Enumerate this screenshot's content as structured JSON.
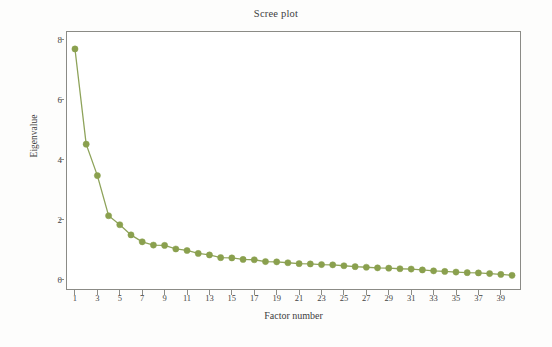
{
  "chart_data": {
    "type": "line",
    "title": "Scree plot",
    "xlabel": "Factor number",
    "ylabel": "Eigenvalue",
    "xlim": [
      0.2,
      40.8
    ],
    "ylim": [
      -0.35,
      8.3
    ],
    "grid": false,
    "legend": null,
    "marker": "circle",
    "series_color": "#8aa04e",
    "line_color": "#8ea35a",
    "x": [
      1,
      2,
      3,
      4,
      5,
      6,
      7,
      8,
      9,
      10,
      11,
      12,
      13,
      14,
      15,
      16,
      17,
      18,
      19,
      20,
      21,
      22,
      23,
      24,
      25,
      26,
      27,
      28,
      29,
      30,
      31,
      32,
      33,
      34,
      35,
      36,
      37,
      38,
      39,
      40
    ],
    "values": [
      7.7,
      4.52,
      3.47,
      2.13,
      1.83,
      1.49,
      1.26,
      1.15,
      1.14,
      1.02,
      0.97,
      0.87,
      0.82,
      0.73,
      0.72,
      0.67,
      0.66,
      0.6,
      0.59,
      0.56,
      0.53,
      0.52,
      0.5,
      0.49,
      0.46,
      0.43,
      0.41,
      0.39,
      0.38,
      0.36,
      0.35,
      0.32,
      0.29,
      0.27,
      0.25,
      0.23,
      0.22,
      0.2,
      0.17,
      0.14
    ],
    "ytick_values": [
      0,
      2,
      4,
      6,
      8
    ],
    "ytick_labels": [
      "0",
      "2",
      "4",
      "6",
      "8"
    ],
    "xtick_values": [
      1,
      3,
      5,
      7,
      9,
      11,
      13,
      15,
      17,
      19,
      21,
      23,
      25,
      27,
      29,
      31,
      33,
      35,
      37,
      39
    ],
    "xtick_labels": [
      "1",
      "3",
      "5",
      "7",
      "9",
      "11",
      "13",
      "15",
      "17",
      "19",
      "21",
      "23",
      "25",
      "27",
      "29",
      "31",
      "33",
      "35",
      "37",
      "39"
    ]
  },
  "attribution": {
    "text": "© Cengage Learning"
  },
  "colors": {
    "series": "#8aa04e",
    "frame": "#8b8b86",
    "text": "#40403e",
    "background": "#fdfdfc"
  }
}
